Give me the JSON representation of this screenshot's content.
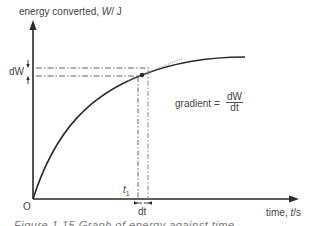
{
  "diagram": {
    "y_axis_label_prefix": "energy converted, ",
    "y_axis_label_var": "W",
    "y_axis_label_unit": "/ J",
    "x_axis_label_prefix": "time, ",
    "x_axis_label_var": "t",
    "x_axis_label_unit": "/s",
    "origin_label": "O",
    "dW_label": "dW",
    "t1_label": "t",
    "t1_subscript": "1",
    "dt_label": "dt",
    "gradient_label": "gradient =",
    "gradient_numerator": "dW",
    "gradient_denominator": "dt",
    "caption": "Figure 1.15   Graph of energy against time"
  },
  "colors": {
    "axis": "#2a2a2a",
    "curve": "#2a2a2a",
    "guide": "#555555",
    "tangent": "#888888"
  }
}
